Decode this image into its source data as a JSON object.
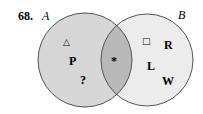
{
  "problem_number": "68.",
  "sets": [
    {
      "label": "A",
      "fill": "#d6d6d6"
    },
    {
      "label": "B",
      "fill": "#ececec"
    }
  ],
  "intersection_fill": "#b8b8b8",
  "outline_color": "#555555",
  "elements": {
    "only_A": [
      "△",
      "P",
      "?"
    ],
    "A_and_B": [
      "*"
    ],
    "only_B": [
      "□",
      "R",
      "L",
      "W"
    ]
  }
}
